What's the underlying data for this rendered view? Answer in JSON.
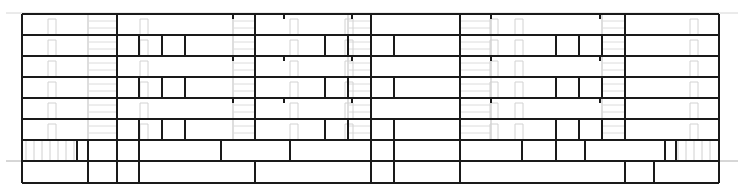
{
  "drawing": {
    "type": "building-elevation",
    "colors": {
      "wall": "#1a1a1a",
      "faint": "#c8c8c8",
      "background": "#ffffff"
    },
    "extents": {
      "left": 22,
      "right": 719,
      "top": 14,
      "ground": 161,
      "bottom": 183
    },
    "ground_line": {
      "y": 161,
      "x1": 6,
      "x2": 738
    },
    "roof_line": {
      "y": 13,
      "x1": 6,
      "x2": 738
    },
    "floor_lines_y": [
      14,
      35,
      56,
      77,
      98,
      119,
      140,
      161,
      183
    ],
    "upper_floors": {
      "count": 6,
      "y_top": 14,
      "y_bottom": 140,
      "main_walls_x": [
        22,
        117,
        255,
        371,
        460,
        625,
        719
      ],
      "short_stubs_x": [
        233,
        284,
        352,
        491,
        600
      ],
      "even_floor_extra_walls_x": [
        139,
        162,
        185,
        325,
        348,
        394,
        556,
        579,
        602
      ]
    },
    "podium_floor": {
      "y_top": 140,
      "y_bottom": 161,
      "walls_x": [
        22,
        77,
        88,
        117,
        139,
        221,
        290,
        371,
        394,
        460,
        522,
        556,
        585,
        665,
        676,
        719
      ]
    },
    "ground_floor": {
      "y_top": 161,
      "y_bottom": 183,
      "walls_x": [
        22,
        88,
        117,
        139,
        255,
        371,
        394,
        460,
        625,
        654,
        719
      ]
    },
    "faint_elements": {
      "stair_bands_x": [
        [
          88,
          117
        ],
        [
          233,
          255
        ],
        [
          348,
          371
        ],
        [
          460,
          491
        ],
        [
          602,
          625
        ]
      ],
      "door_marks_x": [
        48,
        140,
        290,
        345,
        490,
        515,
        690
      ]
    }
  }
}
